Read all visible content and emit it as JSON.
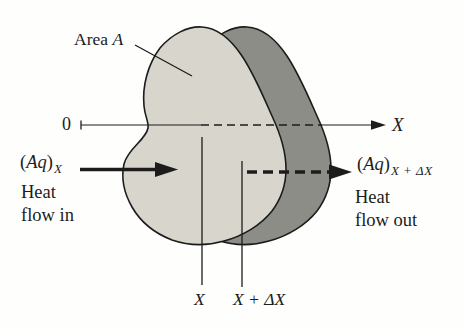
{
  "figure": {
    "colors": {
      "slab_front_fill": "#d8d5cd",
      "slab_back_fill": "#8d8d87",
      "ink": "#1c1c1c"
    },
    "area_label": {
      "prefix": "Area ",
      "variable": "A"
    },
    "axis": {
      "origin_label": "0",
      "axis_label": "X"
    },
    "heat_in": {
      "paren_open": "(",
      "variable": "Aq",
      "paren_close": ")",
      "subscript": "X",
      "caption_line1": "Heat",
      "caption_line2": "flow in"
    },
    "heat_out": {
      "paren_open": "(",
      "variable": "Aq",
      "paren_close": ")",
      "subscript": "X + ΔX",
      "caption_line1": "Heat",
      "caption_line2": "flow out"
    },
    "section_labels": {
      "x_plane": "X",
      "x_plus_dx_plane": "X + ΔX"
    }
  }
}
